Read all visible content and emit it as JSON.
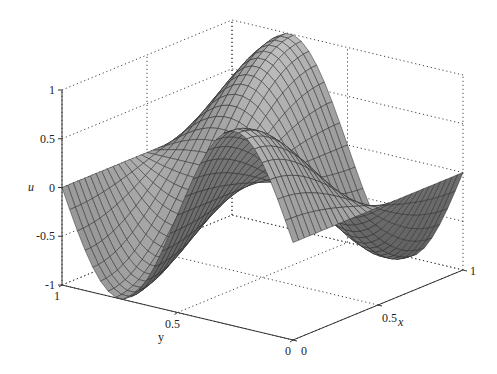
{
  "chart_data": {
    "type": "surface",
    "title": "",
    "xlabel": "x",
    "ylabel": "y",
    "zlabel": "u",
    "xlim": [
      0,
      1
    ],
    "ylim": [
      0,
      1
    ],
    "zlim": [
      -1,
      1
    ],
    "x_ticks": [
      "0",
      "0.5",
      "1"
    ],
    "y_ticks": [
      "0",
      "0.5",
      "1"
    ],
    "z_ticks": [
      "-1",
      "-0.5",
      "0",
      "0.5",
      "1"
    ],
    "z_tick_values": [
      -1,
      -0.5,
      0,
      0.5,
      1
    ],
    "grid": true,
    "mesh_resolution": 30,
    "function": "u(x,y) = sin(2*pi*y) * cos(pi*x)",
    "surface_color": "#9a9a9a",
    "mesh_color": "#2a2a2a",
    "colormap": "gray"
  }
}
